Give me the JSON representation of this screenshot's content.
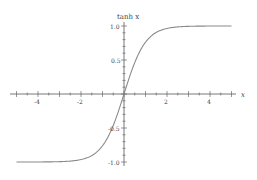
{
  "chart_data": {
    "type": "line",
    "title": "",
    "xlabel": "x",
    "ylabel": "tanh x",
    "xlim": [
      -5.2,
      5.2
    ],
    "ylim": [
      -1.0,
      1.0
    ],
    "xticks": [
      -4,
      -2,
      2,
      4
    ],
    "yticks": [
      -1.0,
      -0.5,
      0.5,
      1.0
    ],
    "ytick_labels": [
      "-1.0",
      "-0.5",
      "0.5",
      "1.0"
    ],
    "grid": false,
    "legend": null,
    "series": [
      {
        "name": "tanh x",
        "x": [
          -5,
          -4,
          -3,
          -2,
          -1.5,
          -1,
          -0.5,
          0,
          0.5,
          1,
          1.5,
          2,
          3,
          4,
          5
        ],
        "values": [
          -0.9999,
          -0.9993,
          -0.9951,
          -0.964,
          -0.9051,
          -0.7616,
          -0.4621,
          0,
          0.4621,
          0.7616,
          0.9051,
          0.964,
          0.9951,
          0.9993,
          0.9999
        ],
        "color": "#888888"
      }
    ]
  },
  "axes": {
    "x_label": "x",
    "y_label": "tanh x",
    "x_tick_labels": [
      "-4",
      "-2",
      "2",
      "4"
    ],
    "y_tick_labels": [
      "1.0",
      "0.5",
      "-0.5",
      "-1.0"
    ]
  }
}
